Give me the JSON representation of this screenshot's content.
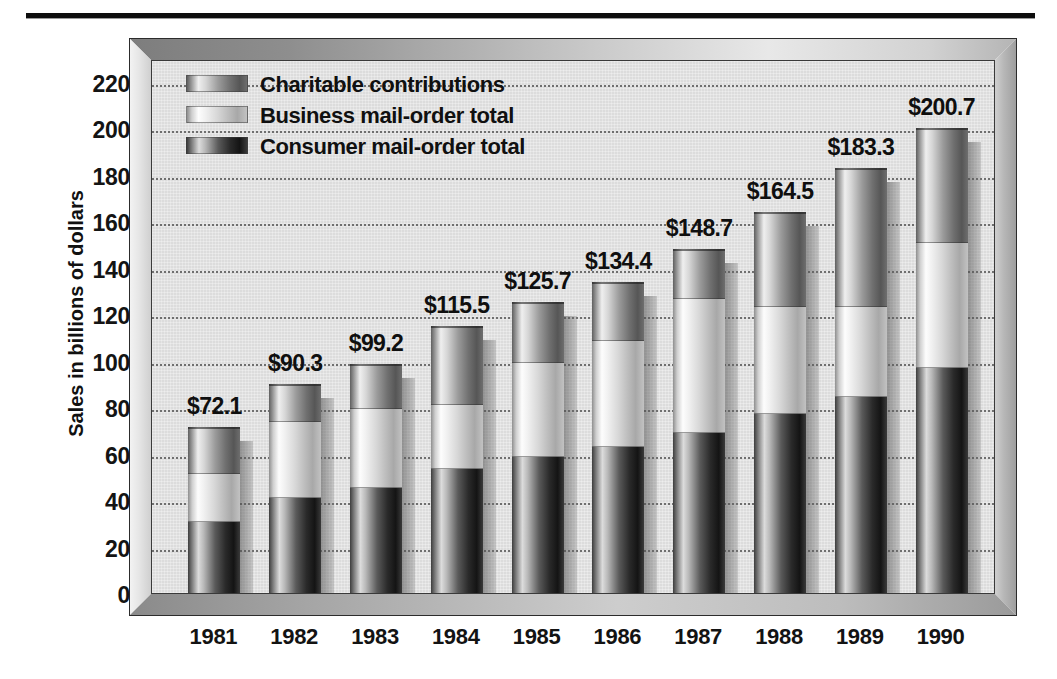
{
  "chart_data": {
    "type": "bar",
    "subtype": "stacked-vertical",
    "title": "",
    "xlabel": "",
    "ylabel": "Sales in billions of dollars",
    "ylim": [
      0,
      220
    ],
    "ytick_step": 20,
    "ytick_labels": [
      "220",
      "200",
      "180",
      "160",
      "140",
      "120",
      "100",
      "80",
      "60",
      "40",
      "20",
      "0"
    ],
    "grid": true,
    "grid_style": "dotted-horizontal",
    "legend_position": "top-left-inside",
    "categories": [
      "1981",
      "1982",
      "1983",
      "1984",
      "1985",
      "1986",
      "1987",
      "1988",
      "1989",
      "1990"
    ],
    "series": [
      {
        "name": "Consumer mail-order total",
        "swatch": "#2a2a2a",
        "values": [
          31.0,
          41.5,
          45.5,
          54.0,
          59.0,
          63.5,
          69.5,
          77.5,
          85.0,
          97.5
        ]
      },
      {
        "name": "Business mail-order total",
        "swatch": "#ededed",
        "values": [
          20.5,
          32.5,
          34.0,
          27.5,
          40.5,
          45.5,
          57.5,
          46.0,
          38.5,
          53.5
        ]
      },
      {
        "name": "Charitable contributions",
        "swatch": "#9b9b9b",
        "values": [
          20.6,
          16.3,
          19.7,
          34.0,
          26.2,
          25.4,
          21.7,
          41.0,
          59.8,
          49.7
        ]
      }
    ],
    "totals": [
      72.1,
      90.3,
      99.2,
      115.5,
      125.7,
      134.4,
      148.7,
      164.5,
      183.3,
      200.7
    ],
    "total_labels": [
      "$72.1",
      "$90.3",
      "$99.2",
      "$115.5",
      "$125.7",
      "$134.4",
      "$148.7",
      "$164.5",
      "$183.3",
      "$200.7"
    ]
  },
  "legend": {
    "items": [
      {
        "label": "Charitable contributions",
        "key": "charitable"
      },
      {
        "label": "Business mail-order total",
        "key": "business"
      },
      {
        "label": "Consumer mail-order total",
        "key": "consumer"
      }
    ]
  },
  "colors": {
    "plot_background": "#dcdcdc",
    "frame_face": "#c9c9c9",
    "grid": "#6f6f6f",
    "text": "#111111",
    "rule": "#0d0d0d"
  }
}
